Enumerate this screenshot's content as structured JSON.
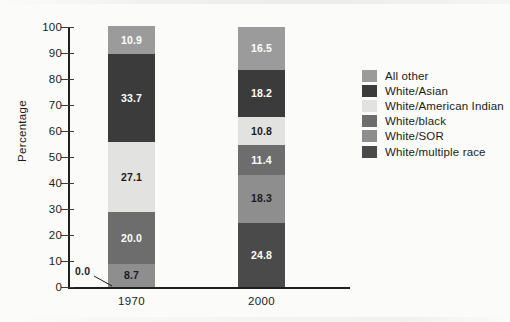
{
  "chart_data": {
    "type": "bar",
    "subtype": "stacked-column-100",
    "title": "",
    "xlabel": "",
    "ylabel": "Percentage",
    "categories": [
      "1970",
      "2000"
    ],
    "ylim": [
      0,
      100
    ],
    "yticks": [
      0,
      10,
      20,
      30,
      40,
      50,
      60,
      70,
      80,
      90,
      100
    ],
    "ytick_labels": [
      "0",
      "10",
      "20",
      "30",
      "40",
      "50",
      "60",
      "70",
      "80",
      "90",
      "100"
    ],
    "grid": false,
    "legend_position": "right",
    "stack_order_bottom_to_top": [
      "White/multiple race",
      "White/SOR",
      "White/black",
      "White/American Indian",
      "White/Asian",
      "All other"
    ],
    "series": [
      {
        "name": "White/multiple race",
        "color": "#4a4a4a",
        "values": [
          0.0,
          24.8
        ],
        "labels": [
          "0.0",
          "24.8"
        ],
        "label_colors": [
          "#1b1b1b",
          "#ffffff"
        ]
      },
      {
        "name": "White/SOR",
        "color": "#8e8e8e",
        "values": [
          8.7,
          18.3
        ],
        "labels": [
          "8.7",
          "18.3"
        ],
        "label_colors": [
          "#1b1b1b",
          "#1b1b1b"
        ]
      },
      {
        "name": "White/black",
        "color": "#6d6d6d",
        "values": [
          20.0,
          11.4
        ],
        "labels": [
          "20.0",
          "11.4"
        ],
        "label_colors": [
          "#ffffff",
          "#ffffff"
        ]
      },
      {
        "name": "White/American Indian",
        "color": "#e2e2e0",
        "values": [
          27.1,
          10.8
        ],
        "labels": [
          "27.1",
          "10.8"
        ],
        "label_colors": [
          "#1b1b1b",
          "#1b1b1b"
        ]
      },
      {
        "name": "White/Asian",
        "color": "#3b3b3b",
        "values": [
          33.7,
          18.2
        ],
        "labels": [
          "33.7",
          "18.2"
        ],
        "label_colors": [
          "#ffffff",
          "#ffffff"
        ]
      },
      {
        "name": "All other",
        "color": "#9b9b9b",
        "values": [
          10.9,
          16.5
        ],
        "labels": [
          "10.9",
          "16.5"
        ],
        "label_colors": [
          "#ffffff",
          "#ffffff"
        ]
      }
    ],
    "annotations": [
      {
        "text": "0.0",
        "points_to_category": "1970",
        "points_to_series": "White/multiple race",
        "note": "leader line from label to zero-height segment at baseline of 1970 bar"
      }
    ]
  },
  "legend": {
    "items": [
      {
        "label": "All other",
        "color": "#9b9b9b"
      },
      {
        "label": "White/Asian",
        "color": "#3b3b3b"
      },
      {
        "label": "White/American Indian",
        "color": "#e2e2e0"
      },
      {
        "label": "White/black",
        "color": "#6d6d6d"
      },
      {
        "label": "White/SOR",
        "color": "#8e8e8e"
      },
      {
        "label": "White/multiple race",
        "color": "#4a4a4a"
      }
    ]
  }
}
